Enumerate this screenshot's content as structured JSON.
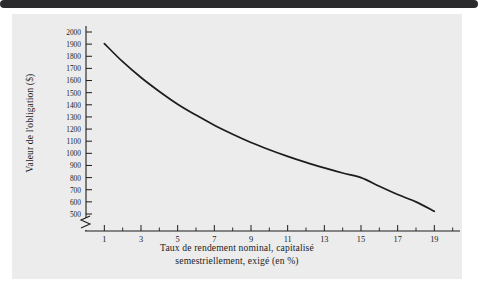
{
  "figure": {
    "background_color": "#ececec",
    "page_background": "#ffffff",
    "top_rule_color": "#2b2b2e",
    "ink_color": "#1c1c1c"
  },
  "chart_data": {
    "type": "line",
    "title": "",
    "subtitle": "",
    "xlabel_line1": "Taux de rendement nominal, capitalisé",
    "xlabel_line2": "semestriellement, exigé (en %)",
    "ylabel": "Valeur de l'obligation ($)",
    "grid": false,
    "legend": "none",
    "axis_break_y": true,
    "xlim": [
      0,
      20.4
    ],
    "ylim": [
      440,
      2060
    ],
    "x_major_ticks": [
      1,
      3,
      5,
      7,
      9,
      11,
      13,
      15,
      17,
      19
    ],
    "x_minor_ticks": [
      2,
      4,
      6,
      8,
      10,
      12,
      14,
      16,
      18,
      20
    ],
    "x_tick_labels": [
      "1",
      "3",
      "5",
      "7",
      "9",
      "11",
      "13",
      "15",
      "17",
      "19"
    ],
    "y_ticks": [
      500,
      600,
      700,
      800,
      900,
      1000,
      1100,
      1200,
      1300,
      1400,
      1500,
      1600,
      1700,
      1800,
      1900,
      2000
    ],
    "y_tick_labels": [
      "500",
      "600",
      "700",
      "800",
      "900",
      "1000",
      "1100",
      "1200",
      "1300",
      "1400",
      "1500",
      "1600",
      "1700",
      "1800",
      "1900",
      "2000"
    ],
    "series": [
      {
        "name": "Valeur de l'obligation",
        "color": "#1c1c1c",
        "x": [
          1,
          2,
          3,
          4,
          5,
          6,
          7,
          8,
          9,
          10,
          11,
          12,
          13,
          14,
          15,
          16,
          17,
          18,
          19
        ],
        "values": [
          1905,
          1755,
          1625,
          1510,
          1405,
          1315,
          1232,
          1158,
          1090,
          1030,
          975,
          925,
          880,
          838,
          800,
          728,
          660,
          600,
          522
        ]
      }
    ]
  },
  "axes": {
    "y_title": "Valeur de l'obligation ($)",
    "x_title_line1": "Taux de rendement nominal, capitalisé",
    "x_title_line2": "semestriellement, exigé (en %)"
  }
}
